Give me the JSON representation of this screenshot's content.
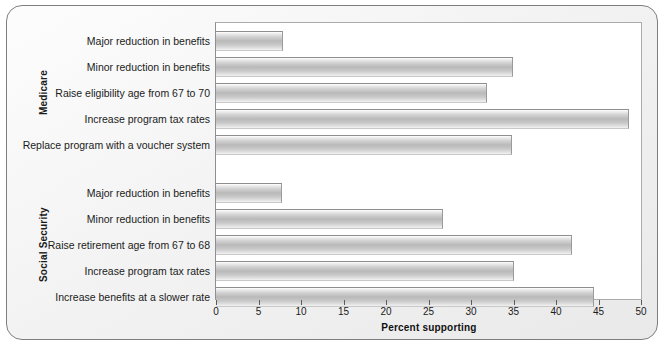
{
  "chart_data": {
    "type": "bar",
    "orientation": "horizontal",
    "title": "",
    "xlabel": "Percent supporting",
    "ylabel": "",
    "xlim": [
      0,
      50
    ],
    "xticks": [
      0,
      5,
      10,
      15,
      20,
      25,
      30,
      35,
      40,
      45,
      50
    ],
    "grid": false,
    "legend": null,
    "groups": [
      {
        "name": "Medicare",
        "categories": [
          "Major reduction in benefits",
          "Minor reduction in benefits",
          "Raise eligibility age from 67 to 70",
          "Increase program tax rates",
          "Replace program with a voucher system"
        ],
        "values": [
          7.8,
          34.8,
          31.8,
          48.5,
          34.7
        ]
      },
      {
        "name": "Social Security",
        "categories": [
          "Major reduction in benefits",
          "Minor reduction in benefits",
          "Raise retirement age from 67 to 68",
          "Increase program tax rates",
          "Increase benefits at a slower rate"
        ],
        "values": [
          7.7,
          26.6,
          41.8,
          34.9,
          44.4
        ]
      }
    ]
  },
  "colors": {
    "bar_light": "#ffffff",
    "bar_mid": "#b9b9b9",
    "bar_edge": "#8e8e8e",
    "frame_border": "#7c7e80",
    "panel_bg": "#f1f1f1",
    "plot_bg": "#ffffff",
    "text": "#1b1b1b"
  }
}
